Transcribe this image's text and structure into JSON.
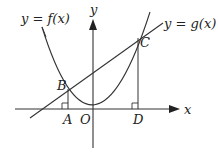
{
  "diagram": {
    "type": "coordinate-geometry",
    "colors": {
      "stroke": "#333333",
      "text": "#222222",
      "background": "#ffffff"
    },
    "axes": {
      "x_label": "x",
      "y_label": "y",
      "origin_label": "O"
    },
    "curves": {
      "f_label": "y = f(x)",
      "g_label": "y = g(x)"
    },
    "points": {
      "A": "A",
      "B": "B",
      "C": "C",
      "D": "D"
    }
  }
}
